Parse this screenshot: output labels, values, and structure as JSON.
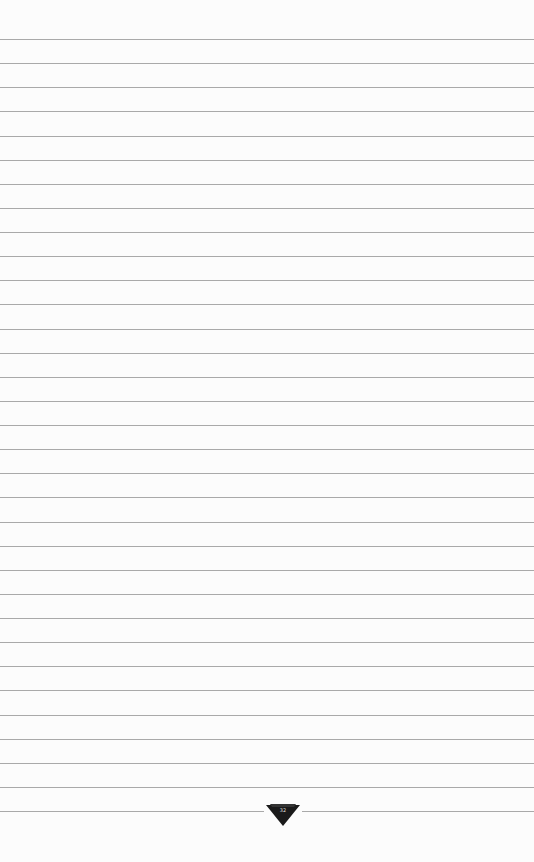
{
  "paper": {
    "type": "lined notepad page",
    "background_color": "#fcfcfc",
    "line_color": "#a9a9a9",
    "line_count": 33,
    "first_line_y": 39,
    "line_spacing": 24.125
  },
  "emblem": {
    "shape": "inverted-triangle",
    "color": "#1a1a1a",
    "text": "32"
  }
}
